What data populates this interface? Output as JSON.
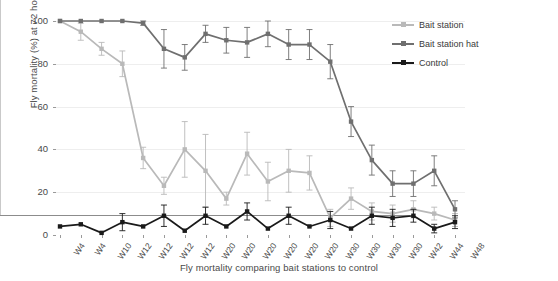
{
  "chart_data": {
    "type": "line",
    "title": "",
    "xlabel": "Fly mortality comparing bait stations to control",
    "ylabel": "Fly mortality (%) at 72 hours",
    "ylim": [
      0,
      100
    ],
    "yticks": [
      0,
      20,
      40,
      60,
      80,
      100
    ],
    "grid": true,
    "legend_position": "upper right",
    "categories": [
      "W4",
      "W4",
      "W10",
      "W12",
      "W12",
      "W12",
      "W12",
      "W20",
      "W20",
      "W20",
      "W20",
      "W20",
      "W20",
      "W30",
      "W30",
      "W30",
      "W30",
      "W42",
      "W44",
      "W48"
    ],
    "series": [
      {
        "name": "Bait station",
        "color": "#b9b9b9",
        "values": [
          100,
          95,
          87,
          80,
          36,
          23,
          40,
          30,
          17,
          38,
          25,
          30,
          29,
          8,
          17,
          11,
          10,
          12,
          10,
          7
        ],
        "errors": [
          0,
          4,
          3,
          6,
          5,
          4,
          13,
          17,
          3,
          10,
          9,
          10,
          8,
          4,
          5,
          4,
          4,
          4,
          3,
          3
        ]
      },
      {
        "name": "Bait station hat",
        "color": "#6f6f6f",
        "values": [
          100,
          100,
          100,
          100,
          99,
          87,
          83,
          94,
          91,
          90,
          94,
          89,
          89,
          81,
          53,
          35,
          24,
          24,
          30,
          12
        ],
        "errors": [
          0,
          0,
          0,
          0,
          1,
          9,
          6,
          4,
          6,
          7,
          6,
          7,
          7,
          8,
          7,
          7,
          6,
          6,
          7,
          4
        ]
      },
      {
        "name": "Control",
        "color": "#1a1a1a",
        "values": [
          4,
          5,
          1,
          6,
          4,
          9,
          2,
          9,
          4,
          11,
          3,
          9,
          4,
          7,
          3,
          9,
          8,
          9,
          3,
          6
        ],
        "errors": [
          0,
          0,
          0,
          4,
          0,
          5,
          0,
          4,
          0,
          4,
          0,
          4,
          0,
          4,
          0,
          4,
          4,
          3,
          2,
          3
        ]
      }
    ]
  },
  "legend": {
    "items": [
      {
        "label": "Bait station"
      },
      {
        "label": "Bait station hat"
      },
      {
        "label": "Control"
      }
    ]
  }
}
